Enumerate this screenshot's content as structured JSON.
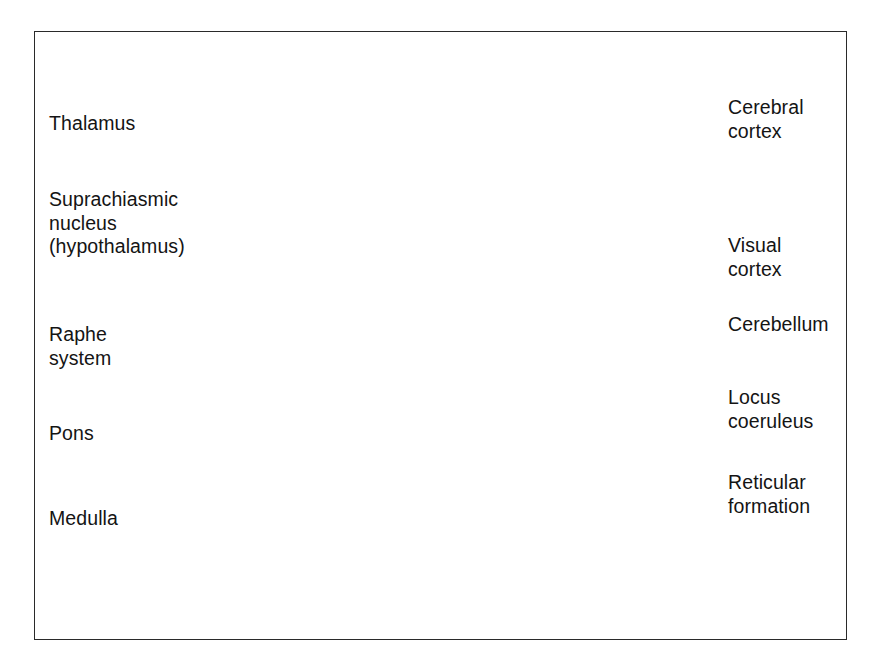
{
  "figure": {
    "border_color": "#2a2a2a",
    "background_color": "#ffffff"
  },
  "labels": {
    "left": [
      {
        "id": "thalamus",
        "text": "Thalamus",
        "lines": [
          "Thalamus"
        ],
        "x": 49,
        "y": 112
      },
      {
        "id": "suprachiasmic-nucleus",
        "text": "Suprachiasmic nucleus (hypothalamus)",
        "lines": [
          "Suprachiasmic",
          "nucleus",
          "(hypothalamus)"
        ],
        "x": 49,
        "y": 188
      },
      {
        "id": "raphe-system",
        "text": "Raphe system",
        "lines": [
          "Raphe",
          "system"
        ],
        "x": 49,
        "y": 323
      },
      {
        "id": "pons",
        "text": "Pons",
        "lines": [
          "Pons"
        ],
        "x": 49,
        "y": 422
      },
      {
        "id": "medulla",
        "text": "Medulla",
        "lines": [
          "Medulla"
        ],
        "x": 49,
        "y": 507
      }
    ],
    "right": [
      {
        "id": "cerebral-cortex",
        "text": "Cerebral cortex",
        "lines": [
          "Cerebral",
          "cortex"
        ],
        "x": 728,
        "y": 96
      },
      {
        "id": "visual-cortex",
        "text": "Visual cortex",
        "lines": [
          "Visual",
          "cortex"
        ],
        "x": 728,
        "y": 234
      },
      {
        "id": "cerebellum",
        "text": "Cerebellum",
        "lines": [
          "Cerebellum"
        ],
        "x": 728,
        "y": 313
      },
      {
        "id": "locus-coeruleus",
        "text": "Locus coeruleus",
        "lines": [
          "Locus",
          "coeruleus"
        ],
        "x": 728,
        "y": 386
      },
      {
        "id": "reticular-formation",
        "text": "Reticular formation",
        "lines": [
          "Reticular",
          "formation"
        ],
        "x": 728,
        "y": 471
      }
    ]
  },
  "structures": [
    {
      "id": "cerebral-cortex",
      "name": "Cerebral cortex"
    },
    {
      "id": "visual-cortex",
      "name": "Visual cortex"
    },
    {
      "id": "cerebellum",
      "name": "Cerebellum"
    },
    {
      "id": "thalamus",
      "name": "Thalamus"
    },
    {
      "id": "suprachiasmic-nucleus",
      "name": "Suprachiasmic nucleus (hypothalamus)"
    },
    {
      "id": "raphe-system",
      "name": "Raphe system"
    },
    {
      "id": "locus-coeruleus",
      "name": "Locus coeruleus"
    },
    {
      "id": "reticular-formation",
      "name": "Reticular formation"
    },
    {
      "id": "pons",
      "name": "Pons"
    },
    {
      "id": "medulla",
      "name": "Medulla"
    },
    {
      "id": "corpus-callosum",
      "name": "Corpus callosum"
    },
    {
      "id": "skull",
      "name": "Skull"
    },
    {
      "id": "face-profile",
      "name": "Face profile"
    }
  ],
  "colors": {
    "outline": "#1b1b1b",
    "skin_light": "#d8d8d8",
    "skin_mid": "#c2c2c2",
    "skin_shadow": "#a8a8a8",
    "brain_fill": "#e3e3e3",
    "brain_shade": "#bdbdbd",
    "sulcus": "#8c8c8c",
    "skull_band": "#c8c8c8",
    "dark_nucleus": "#5a5a5a",
    "reticular_band": "#6e6e6e",
    "cerebellum_fill": "#cfcfcf",
    "leader_line": "#1a1a1a"
  },
  "leaders": [
    {
      "id": "thalamus",
      "from": [
        142,
        122
      ],
      "to": [
        462,
        212
      ]
    },
    {
      "id": "suprachiasmic-nucleus",
      "from": [
        178,
        198
      ],
      "to": [
        455,
        281
      ]
    },
    {
      "id": "raphe-upper",
      "from": [
        128,
        330
      ],
      "to": [
        489,
        289
      ]
    },
    {
      "id": "raphe-lower",
      "from": [
        128,
        332
      ],
      "to": [
        466,
        325
      ]
    },
    {
      "id": "pons",
      "from": [
        118,
        432
      ],
      "to": [
        452,
        297
      ]
    },
    {
      "id": "medulla",
      "from": [
        140,
        517
      ],
      "to": [
        470,
        365
      ]
    },
    {
      "id": "cerebral-cortex",
      "from": [
        722,
        104
      ],
      "to": [
        489,
        107
      ]
    },
    {
      "id": "visual-cortex",
      "from": [
        722,
        243
      ],
      "to": [
        637,
        243
      ]
    },
    {
      "id": "cerebellum",
      "from": [
        722,
        322
      ],
      "to": [
        560,
        296
      ]
    },
    {
      "id": "locus-coeruleus",
      "from": [
        722,
        394
      ],
      "to": [
        489,
        291
      ]
    },
    {
      "id": "reticular-formation",
      "from": [
        722,
        479
      ],
      "to": [
        487,
        330
      ]
    }
  ]
}
